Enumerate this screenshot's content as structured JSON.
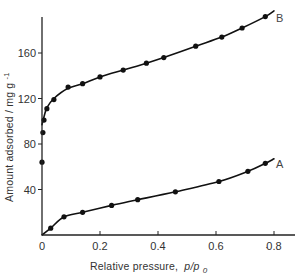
{
  "chart_data": {
    "type": "line",
    "title": "",
    "xlabel": "Relative pressure, p/p₀",
    "xlabel_main": "Relative pressure,",
    "xlabel_var": "p/p",
    "xlabel_sub": "0",
    "ylabel": "Amount adsorbed / mg g⁻¹",
    "ylabel_main": "Amount adsorbed / mg g",
    "ylabel_sup": "-1",
    "xlim": [
      0,
      0.88
    ],
    "ylim": [
      0,
      200
    ],
    "x_ticks": [
      0,
      0.2,
      0.4,
      0.6,
      0.8
    ],
    "x_tick_labels": [
      "0",
      "0.2",
      "0.4",
      "0.6",
      "0.8"
    ],
    "y_ticks": [
      40,
      80,
      120,
      160
    ],
    "y_tick_labels": [
      "40",
      "80",
      "120",
      "160"
    ],
    "grid": false,
    "legend": "none (curves labelled inline A and B)",
    "series": [
      {
        "name": "A",
        "label": "A",
        "x": [
          0.03,
          0.076,
          0.14,
          0.24,
          0.33,
          0.46,
          0.61,
          0.71,
          0.77
        ],
        "y": [
          6,
          16,
          20,
          26,
          31,
          38,
          47,
          56,
          63
        ],
        "curve_x": [
          0.0,
          0.03,
          0.076,
          0.14,
          0.24,
          0.33,
          0.46,
          0.61,
          0.71,
          0.77,
          0.8
        ],
        "curve_y": [
          0,
          6,
          16,
          20,
          26,
          31,
          38,
          47,
          56,
          63,
          67
        ]
      },
      {
        "name": "B",
        "label": "B",
        "x": [
          0.0,
          0.003,
          0.007,
          0.017,
          0.041,
          0.09,
          0.14,
          0.2,
          0.28,
          0.36,
          0.42,
          0.53,
          0.62,
          0.69,
          0.77
        ],
        "y": [
          64,
          90,
          101,
          111,
          119,
          130,
          133,
          139,
          145,
          151,
          156,
          166,
          174,
          182,
          192
        ],
        "curve_x": [
          0.0,
          0.007,
          0.017,
          0.041,
          0.09,
          0.14,
          0.2,
          0.28,
          0.36,
          0.42,
          0.53,
          0.62,
          0.69,
          0.77,
          0.8
        ],
        "curve_y": [
          97,
          104,
          112,
          120,
          129,
          133,
          139,
          145,
          151,
          156,
          166,
          174,
          182,
          192,
          197
        ]
      }
    ]
  },
  "annotations": {
    "series_label_a": "A",
    "series_label_b": "B"
  }
}
